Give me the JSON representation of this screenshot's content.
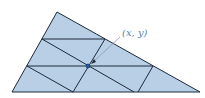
{
  "diagram": {
    "type": "triangle-subdivision",
    "fill_color": "#b8cfe6",
    "stroke_color": "#1e2a3a",
    "point_color": "#1f5fa8",
    "label_color": "#5b7fa8",
    "point_label": "(x, y)",
    "triangle": {
      "top": [
        57,
        12
      ],
      "bottom_left": [
        12,
        92
      ],
      "bottom_right": [
        200,
        92
      ]
    },
    "point": [
      88,
      66
    ],
    "label_position": [
      122,
      36
    ]
  }
}
